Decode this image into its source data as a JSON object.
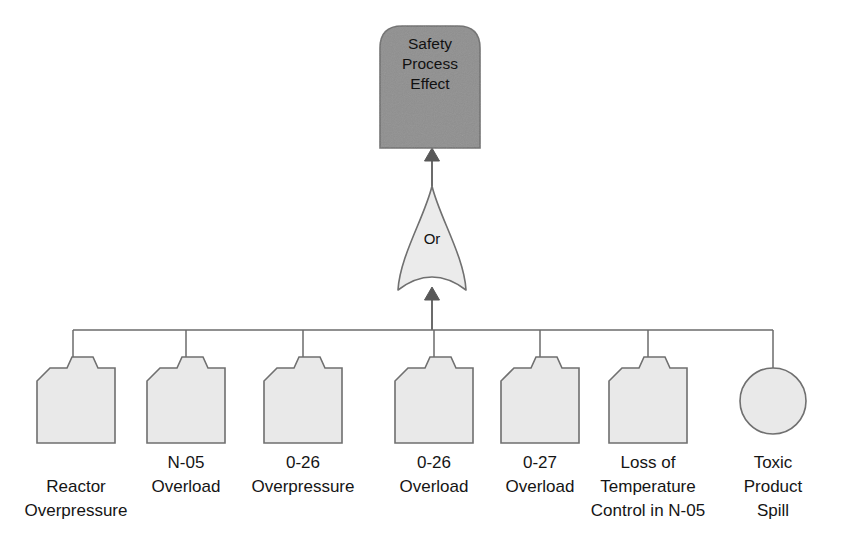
{
  "diagram": {
    "type": "fault-tree",
    "background_color": "#ffffff",
    "stroke_color": "#6f6f6f",
    "line_color": "#6b6b6b",
    "top_node": {
      "id": "safety-process-effect",
      "shape": "dome-top-rectangle",
      "fill_color": "#8f8f8f",
      "lines": [
        "Safety",
        "Process",
        "Effect"
      ],
      "x": 380,
      "y": 26,
      "width": 100,
      "height": 122,
      "dome_radius": 22
    },
    "gate": {
      "id": "or-gate",
      "label": "Or",
      "shape": "or-gate",
      "fill_color": "#ebebeb",
      "cx": 432,
      "top_y": 186,
      "bottom_y": 290,
      "half_width": 34
    },
    "bus": {
      "y": 330,
      "x_start": 73,
      "x_end": 773
    },
    "event_shape": {
      "fill_color": "#e9e9e9",
      "width": 78,
      "height": 75,
      "top_y": 368,
      "bottom_y": 443,
      "chamfer": 13,
      "tab_height": 11,
      "tab_left_offset": 30,
      "tab_right_offset": 56
    },
    "events": [
      {
        "id": "reactor-overpressure",
        "shape": "transfer-box",
        "cx": 76,
        "stem_x": 73,
        "label_lines": [
          "Reactor",
          "Overpressure"
        ],
        "label_line_y": [
          492,
          516
        ]
      },
      {
        "id": "n-05-overload",
        "shape": "transfer-box",
        "cx": 186,
        "stem_x": 186,
        "label_lines": [
          "N-05",
          "Overload"
        ],
        "label_line_y": [
          468,
          492
        ]
      },
      {
        "id": "0-26-overpressure",
        "shape": "transfer-box",
        "cx": 303,
        "stem_x": 303,
        "label_lines": [
          "0-26",
          "Overpressure"
        ],
        "label_line_y": [
          468,
          492
        ]
      },
      {
        "id": "0-26-overload",
        "shape": "transfer-box",
        "cx": 434,
        "stem_x": 434,
        "label_lines": [
          "0-26",
          "Overload"
        ],
        "label_line_y": [
          468,
          492
        ]
      },
      {
        "id": "0-27-overload",
        "shape": "transfer-box",
        "cx": 540,
        "stem_x": 540,
        "label_lines": [
          "0-27",
          "Overload"
        ],
        "label_line_y": [
          468,
          492
        ]
      },
      {
        "id": "loss-of-temperature-control-in-n-05",
        "shape": "transfer-box",
        "cx": 648,
        "stem_x": 648,
        "label_lines": [
          "Loss of",
          "Temperature",
          "Control in N-05"
        ],
        "label_line_y": [
          468,
          492,
          516
        ]
      },
      {
        "id": "toxic-product-spill",
        "shape": "circle",
        "cx": 773,
        "cy": 401,
        "r": 33,
        "stem_x": 773,
        "label_lines": [
          "Toxic",
          "Product",
          "Spill"
        ],
        "label_line_y": [
          468,
          492,
          516
        ]
      }
    ]
  }
}
